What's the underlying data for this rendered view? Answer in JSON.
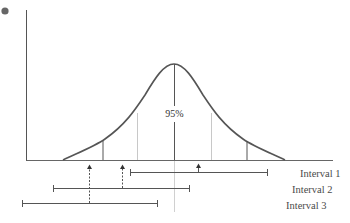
{
  "diagram": {
    "center_label": "95%",
    "intervals": [
      {
        "label": "Interval 1",
        "x_start": 130,
        "x_end": 268,
        "y": 172,
        "arrow_x": 198,
        "arrow_style": "solid",
        "contains_mean": true
      },
      {
        "label": "Interval 2",
        "x_start": 53,
        "x_end": 190,
        "y": 188,
        "arrow_x": 122,
        "arrow_style": "dashed",
        "contains_mean": true
      },
      {
        "label": "Interval 3",
        "x_start": 22,
        "x_end": 158,
        "y": 203,
        "arrow_x": 89,
        "arrow_style": "dashed",
        "contains_mean": false
      }
    ],
    "colors": {
      "axis": "#555555",
      "curve": "#555555",
      "light_line": "#c8c8c8",
      "dot": "#666666"
    }
  }
}
